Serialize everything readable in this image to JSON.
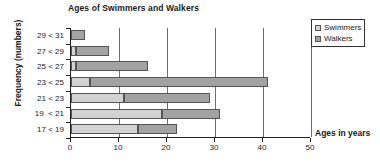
{
  "chart_data": {
    "type": "bar",
    "orientation": "horizontal",
    "stacked": true,
    "title": "Ages of Swimmers and Walkers",
    "xlabel": "Ages in years",
    "ylabel": "Frequency (numbers)",
    "categories": [
      "17 < 19",
      "19  < 21",
      "21 < 23",
      "23 < 25",
      "25 < 27",
      "27 < 29",
      "29 < 31"
    ],
    "categories_top_to_bottom": [
      "29 < 31",
      "27 < 29",
      "25 < 27",
      "23 < 25",
      "21 < 23",
      "19  < 21",
      "17 < 19"
    ],
    "series": [
      {
        "name": "Swimmers",
        "color": "#d2d2d2",
        "values": [
          14,
          19,
          11,
          4,
          1,
          1,
          0
        ]
      },
      {
        "name": "Walkers",
        "color": "#a3a3a3",
        "values": [
          8,
          12,
          18,
          37,
          15,
          7,
          3
        ]
      }
    ],
    "cumulative_totals": [
      22,
      31,
      29,
      41,
      16,
      8,
      3
    ],
    "xlim": [
      0,
      50
    ],
    "xticks": [
      0,
      10,
      20,
      30,
      40,
      50
    ],
    "xticklabels": [
      "0",
      "10",
      "20",
      "30",
      "40",
      "50"
    ],
    "grid": "vertical",
    "legend_position": "top-right"
  },
  "legend": {
    "items": [
      {
        "label": "Swimmers"
      },
      {
        "label": "Walkers"
      }
    ]
  },
  "colors": {
    "swimmers": "#d2d2d2",
    "walkers": "#a3a3a3",
    "axis": "#222222",
    "grid": "#6d6d6d",
    "background": "#ffffff"
  }
}
